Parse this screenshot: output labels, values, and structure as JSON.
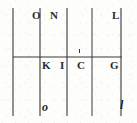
{
  "figure": {
    "ink_color": "#3a3a3a",
    "background_color": "#fdfdfc",
    "labels": {
      "top": [
        {
          "id": "O",
          "text": "O",
          "x": 32,
          "y": 10,
          "style": "upright"
        },
        {
          "id": "N",
          "text": "N",
          "x": 50,
          "y": 10,
          "style": "upright"
        },
        {
          "id": "L",
          "text": "L",
          "x": 112,
          "y": 10,
          "style": "upright"
        }
      ],
      "middle": [
        {
          "id": "K",
          "text": "K",
          "x": 42,
          "y": 60,
          "style": "upright"
        },
        {
          "id": "I",
          "text": "I",
          "x": 60,
          "y": 60,
          "style": "upright"
        },
        {
          "id": "C",
          "text": "C",
          "x": 77,
          "y": 60,
          "style": "upright"
        },
        {
          "id": "G",
          "text": "G",
          "x": 110,
          "y": 60,
          "style": "upright"
        }
      ],
      "bottom": [
        {
          "id": "o-lower",
          "text": "o",
          "x": 42,
          "y": 101,
          "style": "italic"
        },
        {
          "id": "l-lower",
          "text": "l",
          "x": 120,
          "y": 99,
          "style": "italic"
        }
      ]
    },
    "vertical_lines": [
      {
        "id": "line-left-edge",
        "x": 13,
        "y1": 8,
        "y2": 116,
        "width": 1.1
      },
      {
        "id": "line-k",
        "x": 40,
        "y1": 8,
        "y2": 116,
        "width": 1.1
      },
      {
        "id": "line-c",
        "x": 67,
        "y1": 8,
        "y2": 116,
        "width": 1.1
      },
      {
        "id": "line-mid-right",
        "x": 92,
        "y1": 8,
        "y2": 116,
        "width": 1.0
      },
      {
        "id": "line-right-edge",
        "x": 121,
        "y1": 8,
        "y2": 116,
        "width": 1.1
      }
    ],
    "horizontal_lines": [
      {
        "id": "line-baseline",
        "y": 57,
        "x1": 13,
        "x2": 122,
        "width": 1.2
      }
    ],
    "tick_marks": [
      {
        "id": "tick-above-c",
        "x": 79,
        "y": 49
      }
    ]
  }
}
